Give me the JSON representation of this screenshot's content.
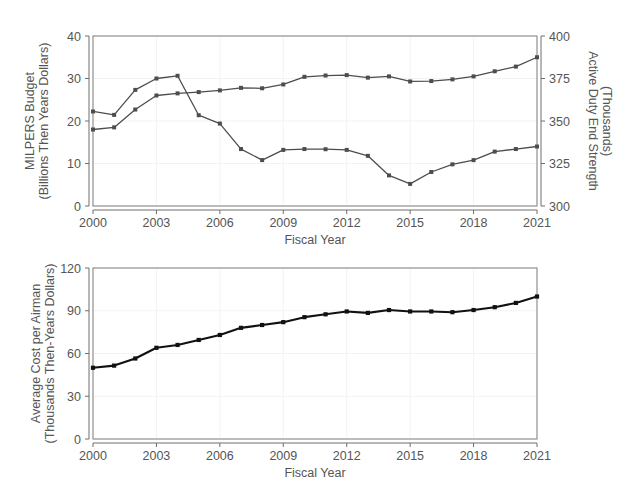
{
  "figure": {
    "width": 623,
    "height": 497,
    "background": "#ffffff",
    "panel_count": 2
  },
  "colors": {
    "series_grey": "#4d4d4d",
    "series_black": "#111111",
    "frame": "#8a8a8a",
    "grid": "#f2f2f2",
    "text": "#555555",
    "axis": "#6e6e6e"
  },
  "chart_data": [
    {
      "type": "line",
      "id": "panel-top",
      "title": "",
      "xlabel": "Fiscal Year",
      "ylabel": "MILPERS Budget\n(Billions Then Years Dollars)",
      "ylabel_line1": "MILPERS Budget",
      "ylabel_line2": "(Billions Then Years Dollars)",
      "y2label_line1": "Active Duty End Strength",
      "y2label_line2": "(Thousands)",
      "grid": true,
      "legend": "none",
      "xlim": [
        2000,
        2021
      ],
      "ylim": [
        0,
        40
      ],
      "y2lim": [
        300,
        400
      ],
      "xticks": [
        2000,
        2003,
        2006,
        2009,
        2012,
        2015,
        2018,
        2021
      ],
      "xticklabels": [
        "2000",
        "2003",
        "2006",
        "2009",
        "2012",
        "2015",
        "2018",
        "2021"
      ],
      "yticks": [
        0,
        10,
        20,
        30,
        40
      ],
      "yticklabels": [
        "0",
        "10",
        "20",
        "30",
        "40"
      ],
      "y2ticks": [
        300,
        325,
        350,
        375,
        400
      ],
      "y2ticklabels": [
        "300",
        "325",
        "350",
        "375",
        "400"
      ],
      "x": [
        2000,
        2001,
        2002,
        2003,
        2004,
        2005,
        2006,
        2007,
        2008,
        2009,
        2010,
        2011,
        2012,
        2013,
        2014,
        2015,
        2016,
        2017,
        2018,
        2019,
        2020,
        2021
      ],
      "series": [
        {
          "name": "MILPERS Budget",
          "axis": "left",
          "units": "Billions Then Years Dollars",
          "color": "#4d4d4d",
          "marker": "square",
          "values": [
            18.0,
            18.5,
            22.7,
            26.0,
            26.5,
            26.8,
            27.2,
            27.8,
            27.7,
            28.6,
            30.4,
            30.7,
            30.8,
            30.2,
            30.5,
            29.3,
            29.4,
            29.8,
            30.5,
            31.7,
            32.8,
            35.0
          ]
        },
        {
          "name": "Active Duty End Strength",
          "axis": "right",
          "units": "Thousands",
          "color": "#4d4d4d",
          "marker": "square",
          "values": [
            355.6,
            353.6,
            368.3,
            375.0,
            376.6,
            353.4,
            348.5,
            333.5,
            327.0,
            333.0,
            333.5,
            333.4,
            333.0,
            329.5,
            318.0,
            313.0,
            320.0,
            324.5,
            327.0,
            332.0,
            333.5,
            335.0
          ]
        }
      ]
    },
    {
      "type": "line",
      "id": "panel-bottom",
      "title": "",
      "xlabel": "Fiscal Year",
      "ylabel": "Average Cost per Airman\n(Thousands Then-Years Dollars)",
      "ylabel_line1": "Average Cost per Airman",
      "ylabel_line2": "(Thousands Then-Years Dollars)",
      "grid": true,
      "legend": "none",
      "xlim": [
        2000,
        2021
      ],
      "ylim": [
        0,
        120
      ],
      "xticks": [
        2000,
        2003,
        2006,
        2009,
        2012,
        2015,
        2018,
        2021
      ],
      "xticklabels": [
        "2000",
        "2003",
        "2006",
        "2009",
        "2012",
        "2015",
        "2018",
        "2021"
      ],
      "yticks": [
        0,
        30,
        60,
        90,
        120
      ],
      "yticklabels": [
        "0",
        "30",
        "60",
        "90",
        "120"
      ],
      "x": [
        2000,
        2001,
        2002,
        2003,
        2004,
        2005,
        2006,
        2007,
        2008,
        2009,
        2010,
        2011,
        2012,
        2013,
        2014,
        2015,
        2016,
        2017,
        2018,
        2019,
        2020,
        2021
      ],
      "series": [
        {
          "name": "Average Cost per Airman",
          "axis": "left",
          "units": "Thousands Then-Years Dollars",
          "color": "#111111",
          "marker": "square",
          "values": [
            50.0,
            51.5,
            56.5,
            64.0,
            66.0,
            69.5,
            73.0,
            78.0,
            80.0,
            82.0,
            85.5,
            87.5,
            89.5,
            88.5,
            90.5,
            89.5,
            89.5,
            89.0,
            90.5,
            92.5,
            95.5,
            100.0
          ]
        }
      ]
    }
  ]
}
